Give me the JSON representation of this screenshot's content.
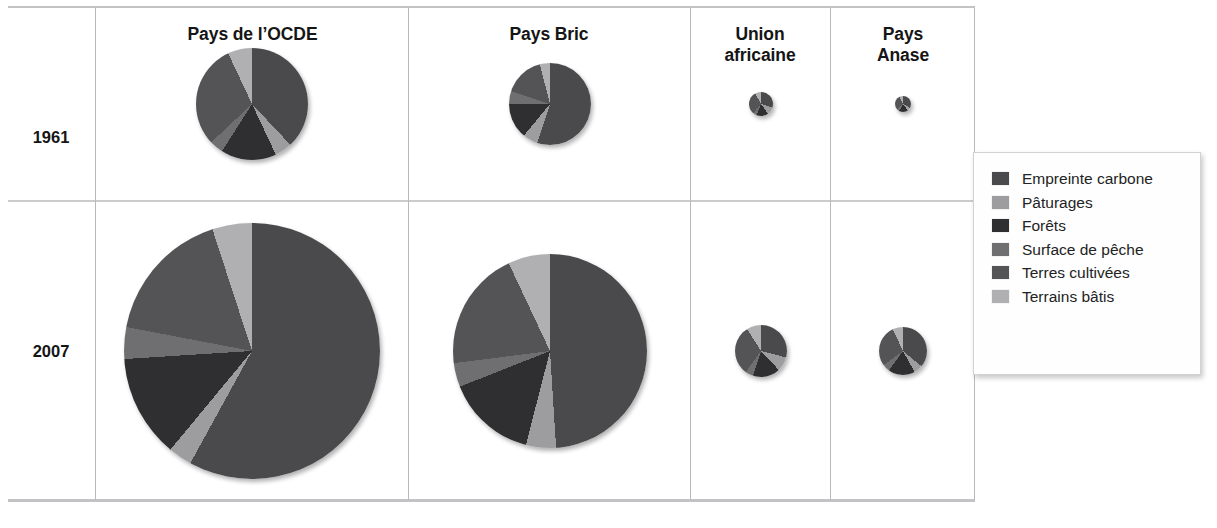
{
  "figure": {
    "kind": "small-multiples-pie-grid",
    "background": "#ffffff"
  },
  "columns": [
    {
      "id": "ocde",
      "label": "Pays de l’OCDE"
    },
    {
      "id": "bric",
      "label": "Pays Bric"
    },
    {
      "id": "ua",
      "label": "Union\nafricaine"
    },
    {
      "id": "anase",
      "label": "Pays Anase"
    }
  ],
  "rows": [
    {
      "id": "1961",
      "label": "1961"
    },
    {
      "id": "2007",
      "label": "2007"
    }
  ],
  "legend": {
    "position": "right",
    "items": [
      {
        "label": "Empreinte carbone",
        "color": "#4a4a4c"
      },
      {
        "label": "Pâturages",
        "color": "#9d9d9f"
      },
      {
        "label": "Forêts",
        "color": "#2f2f31"
      },
      {
        "label": "Surface de pêche",
        "color": "#6f6f72"
      },
      {
        "label": "Terres cultivées",
        "color": "#545456"
      },
      {
        "label": "Terrains bâtis",
        "color": "#b0b0b2"
      }
    ]
  },
  "chart_data": {
    "type": "pie",
    "title": "",
    "subtitle": "",
    "xlabel": "",
    "ylabel": "",
    "legend_position": "right",
    "grid": false,
    "note": "Grid of proportional pies: area scales with total ecological footprint; slices are share of each land-use / footprint category.",
    "categories": [
      "Empreinte carbone",
      "Pâturages",
      "Forêts",
      "Surface de pêche",
      "Terres cultivées",
      "Terrains bâtis"
    ],
    "colors": [
      "#4a4a4c",
      "#9d9d9f",
      "#2f2f31",
      "#6f6f72",
      "#545456",
      "#b0b0b2"
    ],
    "panels": [
      {
        "row": "1961",
        "column": "Pays de l’OCDE",
        "radius_px": 56,
        "values": [
          38,
          5,
          16,
          4,
          30,
          7
        ]
      },
      {
        "row": "1961",
        "column": "Pays Bric",
        "radius_px": 41,
        "values": [
          55,
          6,
          14,
          5,
          16,
          4
        ]
      },
      {
        "row": "1961",
        "column": "Union africaine",
        "radius_px": 12,
        "values": [
          30,
          10,
          16,
          5,
          31,
          8
        ]
      },
      {
        "row": "1961",
        "column": "Pays Anase",
        "radius_px": 8,
        "values": [
          33,
          7,
          18,
          6,
          29,
          7
        ]
      },
      {
        "row": "2007",
        "column": "Pays de l’OCDE",
        "radius_px": 128,
        "values": [
          58,
          3,
          13,
          4,
          17,
          5
        ]
      },
      {
        "row": "2007",
        "column": "Pays Bric",
        "radius_px": 97,
        "values": [
          49,
          5,
          15,
          4,
          20,
          7
        ]
      },
      {
        "row": "2007",
        "column": "Union africaine",
        "radius_px": 26,
        "values": [
          29,
          9,
          17,
          5,
          31,
          9
        ]
      },
      {
        "row": "2007",
        "column": "Pays Anase",
        "radius_px": 24,
        "values": [
          36,
          6,
          18,
          5,
          28,
          7
        ]
      }
    ]
  }
}
